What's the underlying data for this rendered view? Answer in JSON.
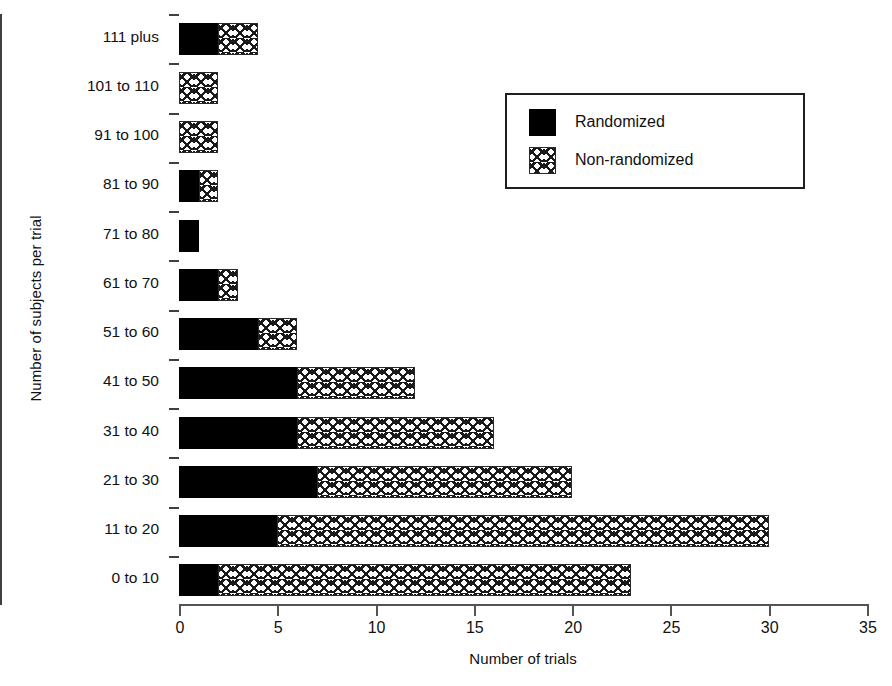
{
  "chart_data": {
    "type": "bar",
    "orientation": "horizontal",
    "stacked": true,
    "title": "",
    "xlabel": "Number of trials",
    "ylabel": "Number of subjects per trial",
    "xlim": [
      0,
      35
    ],
    "xticks": [
      0,
      5,
      10,
      15,
      20,
      25,
      30,
      35
    ],
    "xtick_labels": [
      "0",
      "5",
      "10",
      "15",
      "20",
      "25",
      "30",
      "35"
    ],
    "grid": false,
    "legend_position": "upper right",
    "categories": [
      "111 plus",
      "101 to 110",
      "91 to 100",
      "81 to 90",
      "71 to 80",
      "61 to 70",
      "51 to 60",
      "41 to 50",
      "31 to 40",
      "21 to 30",
      "11 to 20",
      "0 to 10"
    ],
    "series": [
      {
        "name": "Randomized",
        "fill": "solid-black",
        "color": "#000000",
        "values": [
          2,
          0,
          0,
          1,
          1,
          2,
          4,
          6,
          6,
          7,
          5,
          2
        ]
      },
      {
        "name": "Non-randomized",
        "fill": "crosshatch",
        "color": "#ffffff",
        "values": [
          2,
          2,
          2,
          1,
          0,
          1,
          2,
          6,
          10,
          13,
          25,
          21
        ]
      }
    ],
    "totals": [
      4,
      2,
      2,
      2,
      1,
      3,
      6,
      12,
      16,
      20,
      30,
      23
    ]
  },
  "legend": {
    "items": [
      {
        "label": "Randomized"
      },
      {
        "label": "Non-randomized"
      }
    ]
  }
}
